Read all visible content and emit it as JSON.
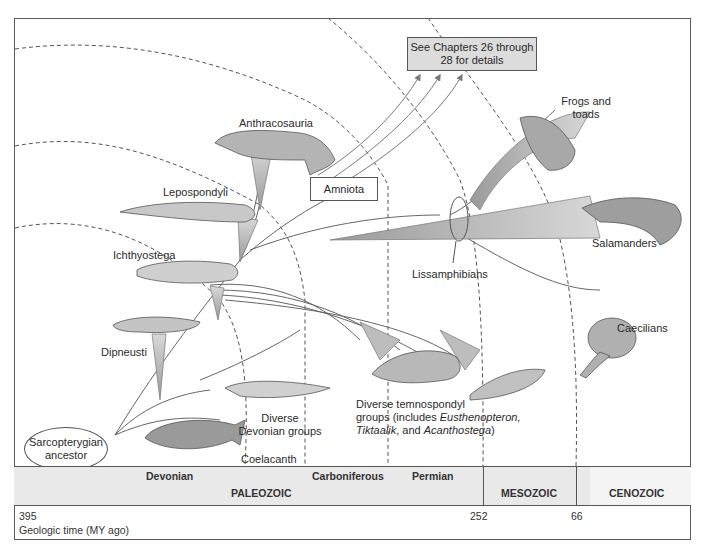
{
  "diagram": {
    "callout_box": {
      "line1": "See Chapters 26 through",
      "line2": "28 for details"
    },
    "amniota_box": "Amniota",
    "root": {
      "line1": "Sarcopterygian",
      "line2": "ancestor"
    },
    "taxa": {
      "anthracosauria": "Anthracosauria",
      "lepospondyli": "Lepospondyli",
      "ichthyostega": "Ichthyostega",
      "dipneusti": "Dipneusti",
      "diverse_devonian": {
        "line1": "Diverse",
        "line2": "Devonian groups"
      },
      "coelacanth": "Coelacanth",
      "temnospondyl": {
        "line1": "Diverse temnospondyl",
        "line2_prefix": "groups (includes ",
        "line2_italic": "Eusthenopteron,",
        "line3_italic1": "Tiktaalik",
        "line3_mid": ", and ",
        "line3_italic2": "Acanthostega",
        "line3_suffix": ")"
      },
      "lissamphibians": "Lissamphibians",
      "frogs": {
        "line1": "Frogs and",
        "line2": "toads"
      },
      "salamanders": "Salamanders",
      "caecilians": "Caecilians"
    },
    "colors": {
      "line": "#555555",
      "fill": "#c8c8c8",
      "band": "#e9e9e9",
      "callout": "#dcdcdc"
    }
  },
  "timescale": {
    "periods": [
      {
        "name": "Devonian"
      },
      {
        "name": "Carboniferous"
      },
      {
        "name": "Permian"
      }
    ],
    "eras": [
      {
        "name": "PALEOZOIC"
      },
      {
        "name": "MESOZOIC"
      },
      {
        "name": "CENOZOIC"
      }
    ],
    "ticks": [
      {
        "value": "395"
      },
      {
        "value": "252"
      },
      {
        "value": "66"
      }
    ],
    "axis_label": "Geologic time (MY ago)"
  }
}
